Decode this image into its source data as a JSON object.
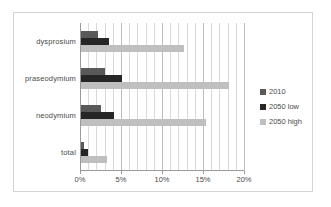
{
  "chart_data": {
    "type": "bar",
    "orientation": "horizontal",
    "title": "",
    "xlabel": "",
    "ylabel": "",
    "categories": [
      "dysprosium",
      "praseodymium",
      "neodymium",
      "total"
    ],
    "series": [
      {
        "name": "2010",
        "color": "#595959",
        "values": [
          2.1,
          2.9,
          2.4,
          0.35
        ]
      },
      {
        "name": "2050 low",
        "color": "#262626",
        "values": [
          3.4,
          5.0,
          4.0,
          0.85
        ]
      },
      {
        "name": "2050 high",
        "color": "#bfbfbf",
        "values": [
          12.6,
          18.0,
          15.2,
          3.2
        ]
      }
    ],
    "xlim": [
      0,
      20
    ],
    "xticks": [
      0,
      5,
      10,
      15,
      20
    ],
    "xtick_labels": [
      "0%",
      "5%",
      "10%",
      "15%",
      "20%"
    ],
    "x_minor_step": 1,
    "grid": "vertical",
    "legend_position": "right",
    "legend_entries": [
      "2010",
      "2050 low",
      "2050 high"
    ],
    "units": "percent"
  },
  "colors": {
    "series_2010": "#595959",
    "series_2050_low": "#262626",
    "series_2050_high": "#bfbfbf",
    "gridline": "#d9d9d9",
    "axis": "#9a9a9a",
    "frame": "#d4d4d4",
    "background": "#ffffff",
    "text": "#4a4a4a"
  }
}
